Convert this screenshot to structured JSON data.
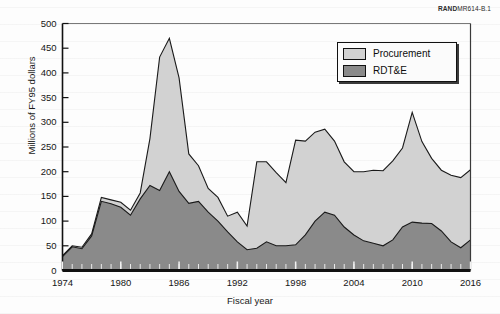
{
  "figure_id": {
    "bold": "RAND",
    "rest": "MR614-B.1"
  },
  "chart_data": {
    "type": "area",
    "stacked": true,
    "title": "",
    "xlabel": "Fiscal year",
    "ylabel": "Millions of FY95 dollars",
    "xlim": [
      1974,
      2016
    ],
    "ylim": [
      0,
      500
    ],
    "ytick_labels": [
      "0",
      "50",
      "100",
      "150",
      "200",
      "250",
      "300",
      "350",
      "400",
      "450",
      "500"
    ],
    "ytick_values": [
      0,
      50,
      100,
      150,
      200,
      250,
      300,
      350,
      400,
      450,
      500
    ],
    "xtick_labels": [
      "1974",
      "1980",
      "1986",
      "1992",
      "1998",
      "2004",
      "2010",
      "2016"
    ],
    "xtick_values": [
      1974,
      1980,
      1986,
      1992,
      1998,
      2004,
      2010,
      2016
    ],
    "minor_xtick_interval": 1,
    "grid": false,
    "legend_position": "top-right",
    "colors": {
      "procurement": "#d2d2d2",
      "rdte": "#8a8a8a",
      "outline": "#1a1a1a",
      "axis": "#111111"
    },
    "x": [
      1974,
      1975,
      1976,
      1977,
      1978,
      1979,
      1980,
      1981,
      1982,
      1983,
      1984,
      1985,
      1986,
      1987,
      1988,
      1989,
      1990,
      1991,
      1992,
      1993,
      1994,
      1995,
      1996,
      1997,
      1998,
      1999,
      2000,
      2001,
      2002,
      2003,
      2004,
      2005,
      2006,
      2007,
      2008,
      2009,
      2010,
      2011,
      2012,
      2013,
      2014,
      2015,
      2016
    ],
    "series": [
      {
        "name": "RDT&E",
        "values": [
          28,
          48,
          44,
          70,
          140,
          135,
          128,
          112,
          145,
          172,
          162,
          200,
          160,
          136,
          140,
          118,
          100,
          78,
          58,
          42,
          45,
          58,
          50,
          50,
          52,
          72,
          100,
          118,
          112,
          88,
          72,
          60,
          55,
          50,
          62,
          88,
          98,
          96,
          95,
          80,
          58,
          46,
          62
        ]
      },
      {
        "name": "Procurement",
        "values": [
          2,
          2,
          3,
          4,
          8,
          8,
          10,
          10,
          12,
          95,
          270,
          270,
          230,
          100,
          72,
          48,
          48,
          32,
          60,
          48,
          175,
          162,
          148,
          128,
          212,
          190,
          180,
          168,
          150,
          132,
          128,
          140,
          148,
          152,
          160,
          160,
          222,
          165,
          132,
          123,
          135,
          142,
          142
        ]
      }
    ],
    "totals": [
      30,
      50,
      47,
      74,
      148,
      143,
      138,
      122,
      157,
      267,
      432,
      470,
      390,
      236,
      212,
      166,
      148,
      110,
      118,
      90,
      220,
      220,
      198,
      178,
      264,
      262,
      280,
      286,
      262,
      220,
      200,
      200,
      203,
      202,
      222,
      248,
      320,
      261,
      227,
      203,
      193,
      188,
      204
    ]
  },
  "legend": {
    "items": [
      {
        "label": "Procurement",
        "color": "#d2d2d2"
      },
      {
        "label": "RDT&E",
        "color": "#8a8a8a"
      }
    ]
  }
}
